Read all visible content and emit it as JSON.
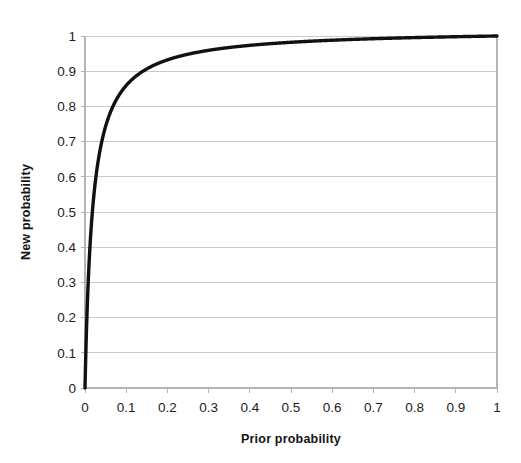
{
  "chart_data": {
    "type": "line",
    "title": "",
    "xlabel": "Prior probability",
    "ylabel": "New probability",
    "xlim": [
      0,
      1
    ],
    "ylim": [
      0,
      1
    ],
    "grid": "horizontal",
    "legend": "none",
    "series_color": "#111111",
    "grid_color": "#c9c9c9",
    "background_color": "#ffffff",
    "x_ticks": [
      "0",
      "0.1",
      "0.2",
      "0.3",
      "0.4",
      "0.5",
      "0.6",
      "0.7",
      "0.8",
      "0.9",
      "1"
    ],
    "x_tick_values": [
      0,
      0.1,
      0.2,
      0.3,
      0.4,
      0.5,
      0.6,
      0.7,
      0.8,
      0.9,
      1
    ],
    "y_ticks": [
      "0",
      "0.1",
      "0.2",
      "0.3",
      "0.4",
      "0.5",
      "0.6",
      "0.7",
      "0.8",
      "0.9",
      "1"
    ],
    "y_tick_values": [
      0,
      0.1,
      0.2,
      0.3,
      0.4,
      0.5,
      0.6,
      0.7,
      0.8,
      0.9,
      1
    ],
    "series": [
      {
        "name": "New probability",
        "x": [
          0,
          0.002,
          0.004,
          0.006,
          0.008,
          0.01,
          0.013,
          0.016,
          0.02,
          0.025,
          0.03,
          0.035,
          0.04,
          0.05,
          0.06,
          0.07,
          0.08,
          0.09,
          0.1,
          0.12,
          0.14,
          0.16,
          0.18,
          0.2,
          0.25,
          0.3,
          0.35,
          0.4,
          0.45,
          0.5,
          0.55,
          0.6,
          0.65,
          0.7,
          0.75,
          0.8,
          0.85,
          0.9,
          0.95,
          1
        ],
        "values": [
          0,
          0.104,
          0.188,
          0.258,
          0.317,
          0.368,
          0.432,
          0.485,
          0.544,
          0.604,
          0.649,
          0.685,
          0.715,
          0.759,
          0.791,
          0.816,
          0.835,
          0.851,
          0.865,
          0.886,
          0.902,
          0.914,
          0.924,
          0.932,
          0.947,
          0.957,
          0.965,
          0.971,
          0.975,
          0.979,
          0.983,
          0.985,
          0.988,
          0.99,
          0.993,
          0.995,
          0.997,
          0.998,
          0.999,
          1
        ]
      }
    ],
    "function_note": "posterior = 55x / (55x + (1 - x))",
    "likelihood_ratio": 55
  },
  "axis_labels": {
    "x_title": "Prior probability",
    "y_title": "New probability"
  }
}
